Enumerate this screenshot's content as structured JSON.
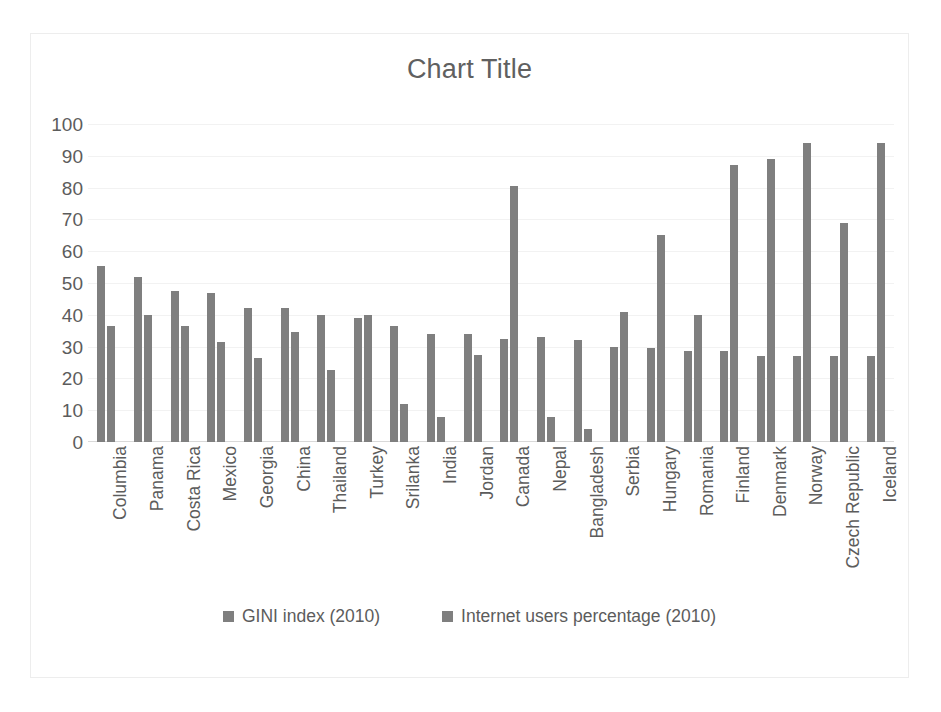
{
  "chart_data": {
    "type": "bar",
    "title": "Chart Title",
    "xlabel": "",
    "ylabel": "",
    "ylim": [
      0,
      100
    ],
    "ytick_step": 10,
    "yticks": [
      100,
      90,
      80,
      70,
      60,
      50,
      40,
      30,
      20,
      10,
      0
    ],
    "grid": true,
    "legend_position": "bottom",
    "bar_color": "#7f7f7f",
    "categories": [
      "Columbia",
      "Panama",
      "Costa Rica",
      "Mexico",
      "Georgia",
      "China",
      "Thailand",
      "Turkey",
      "Srilanka",
      "India",
      "Jordan",
      "Canada",
      "Nepal",
      "Bangladesh",
      "Serbia",
      "Hungary",
      "Romania",
      "Finland",
      "Denmark",
      "Norway",
      "Czech Republic",
      "Iceland"
    ],
    "series": [
      {
        "name": "GINI index (2010)",
        "color": "#7f7f7f",
        "values": [
          55.5,
          52,
          47.5,
          47,
          42,
          42,
          40,
          39,
          36.5,
          34,
          34,
          32.5,
          33,
          32,
          30,
          29.5,
          28.5,
          28.5,
          27,
          27,
          27,
          27
        ]
      },
      {
        "name": "Internet users percentage (2010)",
        "color": "#7f7f7f",
        "values": [
          36.5,
          40,
          36.5,
          31.5,
          26.5,
          34.5,
          22.5,
          40,
          12,
          8,
          27.5,
          80.5,
          8,
          4,
          41,
          65,
          40,
          87,
          89,
          94,
          69,
          94
        ]
      }
    ]
  }
}
